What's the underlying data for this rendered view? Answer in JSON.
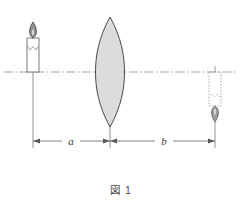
{
  "figure": {
    "caption": "図 1",
    "background_color": "#ffffff",
    "line_color": "#555555",
    "axis_color": "#8a8a8a",
    "lens_fill_color": "#dcdcdc",
    "lens_stroke_color": "#4a4a4a",
    "dotted_color": "#9a9a9a"
  },
  "labels": {
    "object_distance": "a",
    "image_distance": "b"
  },
  "elements": {
    "object_name": "candle",
    "lens_name": "converging-lens",
    "image_name": "inverted-candle-image",
    "axis_name": "optical-axis"
  },
  "geometry": {
    "axis_y": 72,
    "object_x": 33,
    "lens_x": 110,
    "image_x": 215,
    "dimension_y": 141,
    "lens_top_y": 17,
    "lens_bottom_y": 127
  }
}
